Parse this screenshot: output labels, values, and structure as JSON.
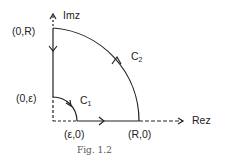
{
  "figure": {
    "caption": "Fig. 1.2",
    "axes": {
      "x_label": "Rez",
      "y_label": "Imz"
    },
    "points": {
      "origin_top": "(0,R)",
      "origin_eps": "(0,ε)",
      "eps_zero": "(ε,0)",
      "r_zero": "(R,0)"
    },
    "contours": [
      {
        "name": "C",
        "subscript": "1",
        "description": "small quarter-circle arc of radius ε, clockwise"
      },
      {
        "name": "C",
        "subscript": "2",
        "description": "large quarter-circle arc of radius R, counter-clockwise"
      }
    ],
    "colors": {
      "stroke": "#222222",
      "text": "#222222",
      "caption": "#555555"
    }
  }
}
